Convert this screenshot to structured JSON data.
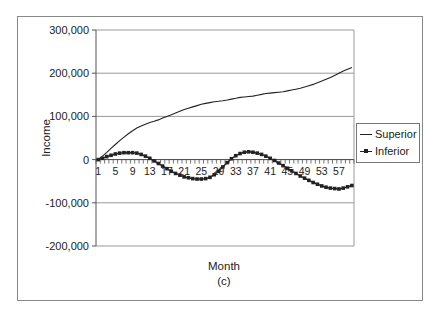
{
  "chart_data": {
    "type": "line",
    "title": "",
    "caption": "(c)",
    "xlabel": "Month",
    "ylabel": "Income",
    "ylim": [
      -200000,
      300000
    ],
    "yticks": [
      300000,
      200000,
      100000,
      0,
      -100000,
      -200000
    ],
    "ytick_labels": [
      "300,000",
      "200,000",
      "100,000",
      "0",
      "-100,000",
      "-200,000"
    ],
    "xtick_labels": [
      "1",
      "5",
      "9",
      "13",
      "17",
      "21",
      "25",
      "29",
      "33",
      "37",
      "41",
      "45",
      "49",
      "53",
      "57"
    ],
    "grid": "horizontal",
    "legend_position": "right",
    "x": [
      1,
      2,
      3,
      4,
      5,
      6,
      7,
      8,
      9,
      10,
      11,
      12,
      13,
      14,
      15,
      16,
      17,
      18,
      19,
      20,
      21,
      22,
      23,
      24,
      25,
      26,
      27,
      28,
      29,
      30,
      31,
      32,
      33,
      34,
      35,
      36,
      37,
      38,
      39,
      40,
      41,
      42,
      43,
      44,
      45,
      46,
      47,
      48,
      49,
      50,
      51,
      52,
      53,
      54,
      55,
      56,
      57,
      58,
      59,
      60
    ],
    "series": [
      {
        "name": "Superior",
        "marker": "none",
        "values": [
          0,
          8000,
          17000,
          26000,
          35000,
          44000,
          52000,
          60000,
          67000,
          73000,
          78000,
          82000,
          86000,
          89000,
          92000,
          96000,
          100000,
          104000,
          108000,
          112000,
          116000,
          119000,
          122000,
          125000,
          128000,
          130000,
          132000,
          134000,
          135000,
          136000,
          138000,
          140000,
          142000,
          144000,
          145000,
          146000,
          147000,
          149000,
          151000,
          153000,
          154000,
          155000,
          156000,
          157000,
          159000,
          161000,
          163000,
          165000,
          168000,
          171000,
          174000,
          178000,
          182000,
          186000,
          190000,
          195000,
          200000,
          205000,
          209000,
          213000
        ]
      },
      {
        "name": "Inferior",
        "marker": "square",
        "values": [
          0,
          3000,
          7000,
          10000,
          13000,
          15000,
          16000,
          16000,
          16000,
          15000,
          12000,
          8000,
          3000,
          -3000,
          -9000,
          -15000,
          -21000,
          -27000,
          -32000,
          -36000,
          -40000,
          -42000,
          -44000,
          -45000,
          -45000,
          -44000,
          -41000,
          -35000,
          -27000,
          -17000,
          -7000,
          2000,
          9000,
          14000,
          17000,
          18000,
          17000,
          15000,
          12000,
          8000,
          3000,
          -2000,
          -8000,
          -14000,
          -20000,
          -26000,
          -32000,
          -38000,
          -43000,
          -48000,
          -53000,
          -57000,
          -61000,
          -64000,
          -66000,
          -67000,
          -68000,
          -66000,
          -63000,
          -60000
        ]
      }
    ]
  },
  "legend": {
    "items": [
      {
        "label": "Superior"
      },
      {
        "label": "Inferior"
      }
    ]
  }
}
